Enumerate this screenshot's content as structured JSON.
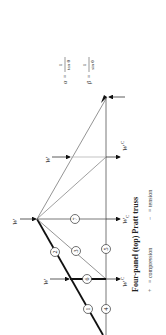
{
  "caption": "Four-panel (top) Pratt truss",
  "legend": {
    "plus_symbol": "+",
    "plus_text": "= compression",
    "minus_symbol": "−",
    "minus_text": "= tension"
  },
  "formulas": {
    "alpha": {
      "symbol": "α",
      "equals": "=",
      "numerator": "1",
      "denominator": "tan θ"
    },
    "beta": {
      "symbol": "β",
      "equals": "=",
      "numerator": "1",
      "denominator": "sin θ"
    }
  },
  "loads": {
    "top_label": "W",
    "bottom_label": "W",
    "bottom_sub": "C"
  },
  "members": [
    "1",
    "2",
    "3",
    "4",
    "5",
    "6",
    "7"
  ]
}
